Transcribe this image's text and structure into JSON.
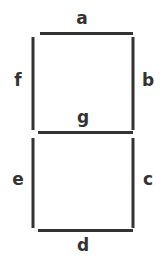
{
  "diagram": {
    "type": "seven-segment-display",
    "background_color": "#ffffff",
    "stroke_color": "#333333",
    "label_color": "#333333",
    "segments": [
      {
        "id": "a",
        "label": "a",
        "orientation": "horizontal",
        "position": "top",
        "x1": 40,
        "y1": 33.5,
        "x2": 133,
        "y2": 33.5,
        "label_x": 82,
        "label_y": 19
      },
      {
        "id": "b",
        "label": "b",
        "orientation": "vertical",
        "position": "upper-right",
        "x1": 133,
        "y1": 37,
        "x2": 133,
        "y2": 130,
        "label_x": 148,
        "label_y": 81
      },
      {
        "id": "c",
        "label": "c",
        "orientation": "vertical",
        "position": "lower-right",
        "x1": 133,
        "y1": 138,
        "x2": 133,
        "y2": 228,
        "label_x": 148,
        "label_y": 180
      },
      {
        "id": "d",
        "label": "d",
        "orientation": "horizontal",
        "position": "bottom",
        "x1": 38,
        "y1": 230.5,
        "x2": 133,
        "y2": 230.5,
        "label_x": 83,
        "label_y": 246
      },
      {
        "id": "e",
        "label": "e",
        "orientation": "vertical",
        "position": "lower-left",
        "x1": 33,
        "y1": 138,
        "x2": 33,
        "y2": 228,
        "label_x": 18,
        "label_y": 180
      },
      {
        "id": "f",
        "label": "f",
        "orientation": "vertical",
        "position": "upper-left",
        "x1": 33,
        "y1": 37,
        "x2": 33,
        "y2": 130,
        "label_x": 18,
        "label_y": 81
      },
      {
        "id": "g",
        "label": "g",
        "orientation": "horizontal",
        "position": "middle",
        "x1": 38,
        "y1": 132.5,
        "x2": 133,
        "y2": 132.5,
        "label_x": 83,
        "label_y": 118
      }
    ]
  }
}
